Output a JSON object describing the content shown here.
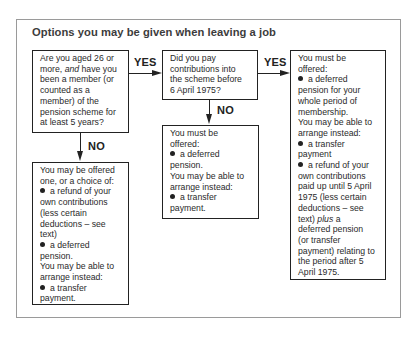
{
  "title": "Options you may be given when leaving a job",
  "labels": {
    "yes_1": "YES",
    "yes_2": "YES",
    "no_1": "NO",
    "no_2": "NO"
  },
  "boxes": {
    "q_age_membership": {
      "lines": [
        "Are you aged 26 or",
        "more, and have you",
        "been a member (or",
        "counted as a",
        "member) of the",
        "pension scheme for",
        "at least 5 years?"
      ]
    },
    "q_contributions_1975": {
      "lines": [
        "Did you pay",
        "contributions into",
        "the scheme before",
        "6 April 1975?"
      ]
    },
    "outcome_yes_yes": {
      "lines": [
        "You must be",
        "offered:",
        "a deferred",
        "pension for your",
        "whole period of",
        "membership.",
        "You may be able to",
        "arrange instead:",
        "a transfer",
        "payment",
        "a refund of your",
        "own contributions",
        "paid up until 5 April",
        "1975 (less certain",
        "deductions – see",
        "text) plus a",
        "deferred pension",
        "(or transfer",
        "payment) relating to",
        "the period after 5",
        "April 1975."
      ]
    },
    "outcome_yes_no": {
      "lines": [
        "You must be",
        "offered:",
        "a deferred",
        "pension.",
        "You may be able to",
        "arrange instead:",
        "a transfer",
        "payment."
      ]
    },
    "outcome_no": {
      "lines": [
        "You may be offered",
        "one, or a choice of:",
        "a refund of your",
        "own contributions",
        "(less certain",
        "deductions – see",
        "text)",
        "a deferred",
        "pension.",
        "You may be able to",
        "arrange instead:",
        "a transfer",
        "payment."
      ]
    }
  },
  "colors": {
    "border": "#222222",
    "frame": "#9a9a9a",
    "title": "#3c3c3c"
  }
}
